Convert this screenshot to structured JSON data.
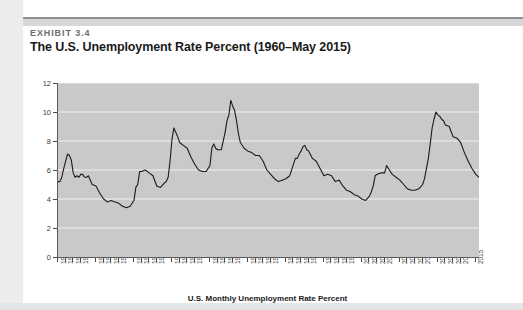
{
  "exhibit": {
    "label": "EXHIBIT 3.4",
    "title": "The U.S. Unemployment Rate Percent (1960–May 2015)"
  },
  "colors": {
    "plot_background": "#c9c9c9",
    "gridline": "#f2f2f2",
    "series_line": "#1a1a1a",
    "axis": "#5b5b5b",
    "page_background": "#ffffff",
    "margin_band": "#ececed",
    "label_text": "#3d3d3d",
    "exhibit_label_text": "#6d6e71"
  },
  "chart_data": {
    "type": "line",
    "title": "The U.S. Unemployment Rate Percent (1960–May 2015)",
    "xlabel": "U.S. Monthly Unemployment Rate Percent",
    "ylabel": "",
    "ylim": [
      0,
      12
    ],
    "xlim": [
      1960,
      2015.42
    ],
    "grid": true,
    "legend": "none",
    "y_ticks": [
      0,
      2,
      4,
      6,
      8,
      10,
      12
    ],
    "x_tick_labels": [
      "1960",
      "1961",
      "1962",
      "1963",
      "1965",
      "1966",
      "1967",
      "1968",
      "1970",
      "1971",
      "1972",
      "1973",
      "1975",
      "1976",
      "1977",
      "1978",
      "1980",
      "1981",
      "1982",
      "1983",
      "1985",
      "1986",
      "1987",
      "1988",
      "1990",
      "1991",
      "1992",
      "1993",
      "1995",
      "1996",
      "1997",
      "1998",
      "2000",
      "2001",
      "2002",
      "2003",
      "2005",
      "2006",
      "2007",
      "2008",
      "2010",
      "2011",
      "2012",
      "2013",
      "2015"
    ],
    "x_tick_values": [
      1960,
      1961,
      1962,
      1963,
      1965,
      1966,
      1967,
      1968,
      1970,
      1971,
      1972,
      1973,
      1975,
      1976,
      1977,
      1978,
      1980,
      1981,
      1982,
      1983,
      1985,
      1986,
      1987,
      1988,
      1990,
      1991,
      1992,
      1993,
      1995,
      1996,
      1997,
      1998,
      2000,
      2001,
      2002,
      2003,
      2005,
      2006,
      2007,
      2008,
      2010,
      2011,
      2012,
      2013,
      2015
    ],
    "series": [
      {
        "name": "U.S. Monthly Unemployment Rate Percent",
        "x": [
          1960.0,
          1960.25,
          1960.5,
          1960.75,
          1961.0,
          1961.25,
          1961.5,
          1961.75,
          1962.0,
          1962.25,
          1962.5,
          1962.75,
          1963.0,
          1963.25,
          1963.5,
          1963.75,
          1964.0,
          1964.5,
          1965.0,
          1965.5,
          1966.0,
          1966.5,
          1967.0,
          1967.5,
          1968.0,
          1968.5,
          1969.0,
          1969.5,
          1970.0,
          1970.25,
          1970.5,
          1970.75,
          1971.0,
          1971.5,
          1972.0,
          1972.5,
          1973.0,
          1973.5,
          1974.0,
          1974.25,
          1974.5,
          1974.75,
          1975.0,
          1975.25,
          1975.5,
          1975.75,
          1976.0,
          1976.5,
          1977.0,
          1977.5,
          1978.0,
          1978.5,
          1979.0,
          1979.5,
          1980.0,
          1980.25,
          1980.5,
          1980.75,
          1981.0,
          1981.5,
          1982.0,
          1982.25,
          1982.5,
          1982.75,
          1983.0,
          1983.25,
          1983.5,
          1983.75,
          1984.0,
          1984.5,
          1985.0,
          1985.5,
          1986.0,
          1986.5,
          1987.0,
          1987.5,
          1988.0,
          1988.5,
          1989.0,
          1989.5,
          1990.0,
          1990.5,
          1991.0,
          1991.25,
          1991.5,
          1991.75,
          1992.0,
          1992.25,
          1992.5,
          1992.75,
          1993.0,
          1993.5,
          1994.0,
          1994.5,
          1995.0,
          1995.5,
          1996.0,
          1996.5,
          1997.0,
          1997.5,
          1998.0,
          1998.5,
          1999.0,
          1999.5,
          2000.0,
          2000.5,
          2001.0,
          2001.25,
          2001.5,
          2001.75,
          2002.0,
          2002.5,
          2003.0,
          2003.25,
          2003.5,
          2003.75,
          2004.0,
          2004.5,
          2005.0,
          2005.5,
          2006.0,
          2006.5,
          2007.0,
          2007.5,
          2008.0,
          2008.25,
          2008.5,
          2008.75,
          2009.0,
          2009.25,
          2009.5,
          2009.75,
          2010.0,
          2010.25,
          2010.5,
          2010.75,
          2011.0,
          2011.5,
          2012.0,
          2012.5,
          2013.0,
          2013.5,
          2014.0,
          2014.5,
          2015.0,
          2015.42
        ],
        "y": [
          5.2,
          5.2,
          5.5,
          6.1,
          6.6,
          7.1,
          7.0,
          6.7,
          5.8,
          5.5,
          5.6,
          5.5,
          5.7,
          5.7,
          5.5,
          5.5,
          5.6,
          5.0,
          4.9,
          4.4,
          4.0,
          3.8,
          3.9,
          3.8,
          3.7,
          3.5,
          3.4,
          3.5,
          3.9,
          4.8,
          5.0,
          5.9,
          5.9,
          6.0,
          5.8,
          5.6,
          4.9,
          4.8,
          5.1,
          5.2,
          5.5,
          6.6,
          8.1,
          8.9,
          8.6,
          8.3,
          7.9,
          7.7,
          7.5,
          6.9,
          6.4,
          6.0,
          5.9,
          5.9,
          6.3,
          7.5,
          7.8,
          7.5,
          7.4,
          7.4,
          8.6,
          9.4,
          9.8,
          10.8,
          10.4,
          10.1,
          9.4,
          8.5,
          7.9,
          7.5,
          7.3,
          7.2,
          7.0,
          7.0,
          6.6,
          6.0,
          5.7,
          5.4,
          5.2,
          5.3,
          5.4,
          5.6,
          6.4,
          6.8,
          6.8,
          7.1,
          7.3,
          7.6,
          7.7,
          7.4,
          7.3,
          6.8,
          6.6,
          6.1,
          5.6,
          5.7,
          5.6,
          5.2,
          5.3,
          4.9,
          4.6,
          4.5,
          4.3,
          4.2,
          4.0,
          3.9,
          4.2,
          4.5,
          4.9,
          5.6,
          5.7,
          5.8,
          5.8,
          6.3,
          6.1,
          5.9,
          5.7,
          5.5,
          5.3,
          5.0,
          4.7,
          4.6,
          4.6,
          4.7,
          5.0,
          5.4,
          6.1,
          6.8,
          7.8,
          8.9,
          9.5,
          10.0,
          9.8,
          9.7,
          9.5,
          9.4,
          9.1,
          9.0,
          8.3,
          8.2,
          7.9,
          7.2,
          6.6,
          6.1,
          5.7,
          5.5
        ]
      }
    ],
    "annotations": {
      "peak_1961": 7.1,
      "trough_1969": 3.4,
      "peak_1975": 8.9,
      "peak_1982": 10.8,
      "peak_1992": 7.7,
      "trough_2000": 3.9,
      "peak_2009": 10.0,
      "end_2015": 5.5
    }
  },
  "axis_titles": {
    "x": "U.S. Monthly Unemployment Rate Percent"
  }
}
